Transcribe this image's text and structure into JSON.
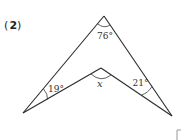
{
  "problem": {
    "open_paren": "(",
    "number": "2",
    "close_paren": ")"
  },
  "figure": {
    "type": "concave quadrilateral (arrowhead / boomerang)",
    "angles": {
      "apex": "76°",
      "left": "19°",
      "right": "21°",
      "reflex_inner": "x"
    }
  },
  "partial_bracket": "["
}
